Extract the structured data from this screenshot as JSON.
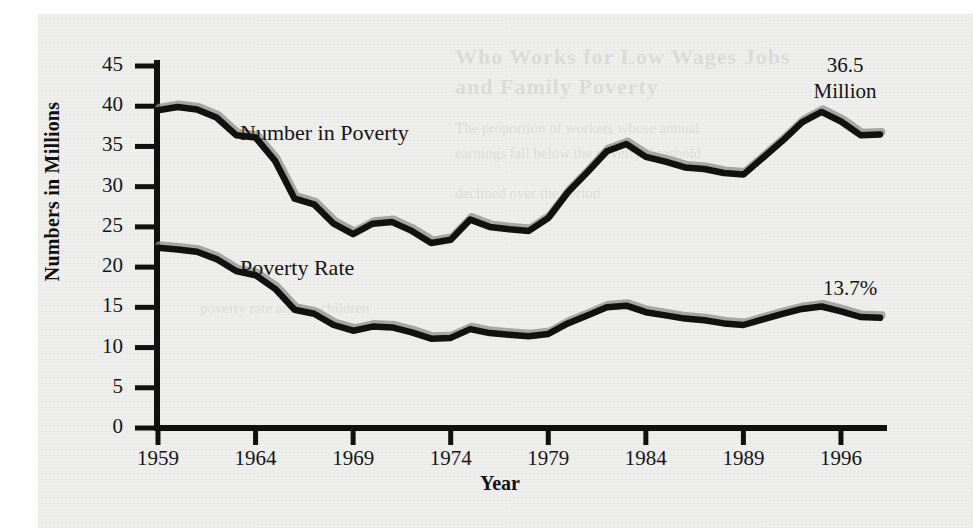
{
  "figure": {
    "y_axis_title": "Numbers in Millions",
    "x_axis_title": "Year"
  },
  "labels": {
    "number_in_poverty": "Number in Poverty",
    "poverty_rate": "Poverty Rate"
  },
  "callouts": {
    "number_line1": "36.5",
    "number_line2": "Million",
    "rate": "13.7%"
  },
  "chart_data": {
    "type": "line",
    "title": "",
    "xlabel": "Year",
    "ylabel": "Numbers in Millions",
    "xlim": [
      1959,
      1996
    ],
    "ylim": [
      0,
      45
    ],
    "ytick_labels": [
      "45",
      "40",
      "35",
      "30",
      "25",
      "20",
      "15",
      "10",
      "5",
      "0"
    ],
    "yticks": [
      45,
      40,
      35,
      30,
      25,
      20,
      15,
      10,
      5,
      0
    ],
    "xtick_labels": [
      "1959",
      "1964",
      "1969",
      "1974",
      "1979",
      "1984",
      "1989",
      "1996"
    ],
    "xticks": [
      1959,
      1964,
      1969,
      1974,
      1979,
      1984,
      1989,
      1994
    ],
    "grid": false,
    "legend": "inline-labels",
    "x": [
      1959,
      1960,
      1961,
      1962,
      1963,
      1964,
      1965,
      1966,
      1967,
      1968,
      1969,
      1970,
      1971,
      1972,
      1973,
      1974,
      1975,
      1976,
      1977,
      1978,
      1979,
      1980,
      1981,
      1982,
      1983,
      1984,
      1985,
      1986,
      1987,
      1988,
      1989,
      1990,
      1991,
      1992,
      1993,
      1994,
      1995,
      1996
    ],
    "series": [
      {
        "name": "Number in Poverty",
        "units": "millions",
        "end_label": "36.5 Million",
        "values": [
          39.5,
          39.9,
          39.6,
          38.6,
          36.4,
          36.1,
          33.2,
          28.5,
          27.8,
          25.4,
          24.1,
          25.4,
          25.6,
          24.5,
          23.0,
          23.4,
          25.9,
          25.0,
          24.7,
          24.5,
          26.1,
          29.3,
          31.8,
          34.4,
          35.3,
          33.7,
          33.1,
          32.4,
          32.2,
          31.7,
          31.5,
          33.6,
          35.7,
          38.0,
          39.3,
          38.1,
          36.4,
          36.5
        ]
      },
      {
        "name": "Poverty Rate",
        "units": "percent",
        "end_label": "13.7%",
        "values": [
          22.4,
          22.2,
          21.9,
          21.0,
          19.5,
          19.0,
          17.3,
          14.7,
          14.2,
          12.8,
          12.1,
          12.6,
          12.5,
          11.9,
          11.1,
          11.2,
          12.3,
          11.8,
          11.6,
          11.4,
          11.7,
          13.0,
          14.0,
          15.0,
          15.2,
          14.4,
          14.0,
          13.6,
          13.4,
          13.0,
          12.8,
          13.5,
          14.2,
          14.8,
          15.1,
          14.5,
          13.8,
          13.7
        ]
      }
    ]
  },
  "colors": {
    "line": "#111111",
    "line_shadow": "#8f8f8f",
    "paper": "#efefed",
    "text": "#141414"
  },
  "ghost_text": {
    "l1": "Who Works for Low Wages Jobs",
    "l2": "and Family Poverty",
    "l3": "The proportion of workers whose annual",
    "l4": "earnings fall below the poverty threshold",
    "l5": "declined over the period",
    "l6": "poverty rate among children"
  }
}
